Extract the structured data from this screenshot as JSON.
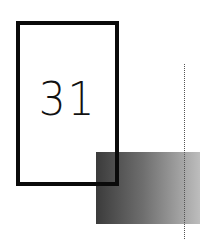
{
  "graphic": {
    "number": "31",
    "colors": {
      "frame": "#0a0a0a",
      "gradient_start": "#3b3b3b",
      "gradient_end": "#bdbdbd",
      "dotted_line": "#555555",
      "background": "#ffffff"
    }
  }
}
